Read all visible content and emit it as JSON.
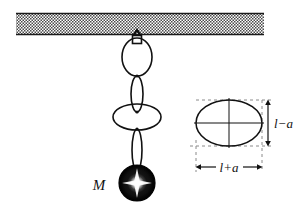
{
  "figure": {
    "background_color": "#ffffff",
    "ink_color": "#111111",
    "hatch_color": "#555555",
    "dash_color": "#888888",
    "ball_color": "#080808",
    "highlight_color": "#ffffff"
  },
  "ceiling": {
    "name": "hatched-ceiling",
    "x": 16,
    "y": 13,
    "width": 248,
    "height": 22
  },
  "pendulum": {
    "hook": {
      "name": "ceiling-hook",
      "cx": 137,
      "cy": 38
    },
    "chain_links": [
      {
        "name": "chain-link-1",
        "cx": 137,
        "cy": 57,
        "rx": 15,
        "ry": 19,
        "shape": "wide-ellipse"
      },
      {
        "name": "chain-link-2",
        "cx": 137,
        "cy": 94,
        "rx": 6,
        "ry": 18,
        "shape": "narrow-ellipse"
      },
      {
        "name": "chain-link-3",
        "cx": 137,
        "cy": 117,
        "rx": 24,
        "ry": 13,
        "shape": "wide-ellipse"
      },
      {
        "name": "chain-link-4",
        "cx": 137,
        "cy": 150,
        "rx": 5,
        "ry": 21,
        "shape": "narrow-ellipse"
      }
    ],
    "ball": {
      "name": "pendulum-ball",
      "cx": 137,
      "cy": 183,
      "r": 18
    },
    "mass_label": {
      "name": "mass-label",
      "text": "M",
      "x": 99,
      "y": 190
    }
  },
  "ellipse_inset": {
    "name": "ellipse-geometry-inset",
    "ellipse": {
      "cx": 229,
      "cy": 123,
      "rx": 33,
      "ry": 23
    },
    "axes": {
      "horizontal": true,
      "vertical": true
    },
    "bounding_box": {
      "x": 196,
      "y": 100,
      "width": 66,
      "height": 46
    },
    "vertical_dimension": {
      "name": "minor-axis-dimension",
      "label": "l−a",
      "label_x": 276,
      "label_y": 128,
      "arrow_x": 268,
      "arrow_top": 100,
      "arrow_bottom": 146
    },
    "horizontal_dimension": {
      "name": "major-axis-dimension",
      "label": "l+a",
      "label_x": 229,
      "label_y": 172,
      "arrow_y": 167,
      "arrow_left": 196,
      "arrow_right": 262
    }
  }
}
